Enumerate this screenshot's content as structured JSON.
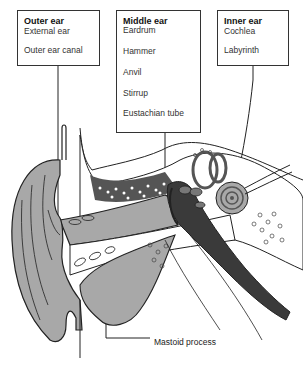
{
  "diagram": {
    "type": "anatomy-cross-section",
    "groups": [
      {
        "title": "Outer ear",
        "items": [
          "External ear",
          "Outer ear canal"
        ]
      },
      {
        "title": "Middle ear",
        "items": [
          "Eardrum",
          "Hammer",
          "Anvil",
          "Stirrup",
          "Eustachian tube"
        ]
      },
      {
        "title": "Inner ear",
        "items": [
          "Cochlea",
          "Labyrinth"
        ]
      }
    ],
    "callouts": {
      "mastoid": "Mastoid process"
    },
    "colors": {
      "soft_tissue": "#a8a8a8",
      "dark_cavity": "#3a3a3a",
      "bone": "#ffffff",
      "outline": "#222222"
    }
  }
}
